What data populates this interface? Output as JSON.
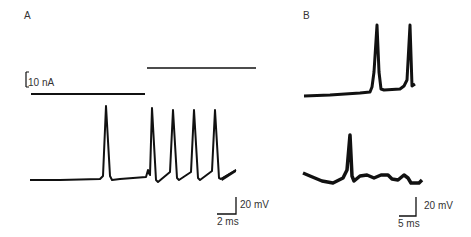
{
  "figure": {
    "panel_a": {
      "label": "A",
      "current_scale": "10 nA",
      "voltage_scale": "20 mV",
      "time_scale": "2 ms",
      "description": "Current step (lower then higher) with evoked action potentials: one spike at low step, four repetitive spikes at higher step"
    },
    "panel_b": {
      "label": "B",
      "voltage_scale": "20 mV",
      "time_scale": "5 ms",
      "description": "Top trace: two spikes arising from baseline; bottom trace: single spike on oscillating baseline"
    }
  },
  "colors": {
    "trace": "#111111",
    "background": "#ffffff"
  }
}
